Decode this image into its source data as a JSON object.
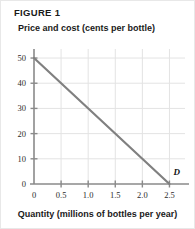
{
  "figure": {
    "number_label": "FIGURE 1",
    "y_axis_title": "Price and cost (cents per bottle)",
    "x_axis_title": "Quantity (millions of bottles per year)"
  },
  "colors": {
    "curve": "#808080",
    "axis": "#8a8a8a",
    "grid": "#e3e3e3",
    "text": "#1a1a1a",
    "border": "#e8e8e8"
  },
  "chart_data": {
    "type": "line",
    "title": "FIGURE 1",
    "xlabel": "Quantity (millions of bottles per year)",
    "ylabel": "Price and cost (cents per bottle)",
    "xlim": [
      0,
      2.75
    ],
    "ylim": [
      0,
      52
    ],
    "grid": true,
    "legend": "none",
    "x_ticks": [
      0,
      0.5,
      1.0,
      1.5,
      2.0,
      2.5
    ],
    "x_tick_labels": [
      "0",
      "0.5",
      "1.0",
      "1.5",
      "2.0",
      "2.5"
    ],
    "y_ticks": [
      0,
      10,
      20,
      30,
      40,
      50
    ],
    "y_tick_labels": [
      "0",
      "10",
      "20",
      "30",
      "40",
      "50"
    ],
    "series": [
      {
        "name": "D",
        "label": "D",
        "annotation": "D",
        "color": "#808080",
        "x": [
          0,
          2.5
        ],
        "y": [
          50,
          0
        ],
        "points": [
          [
            0,
            50
          ],
          [
            2.5,
            0
          ]
        ],
        "slope": -20,
        "intercept": 50
      }
    ]
  }
}
